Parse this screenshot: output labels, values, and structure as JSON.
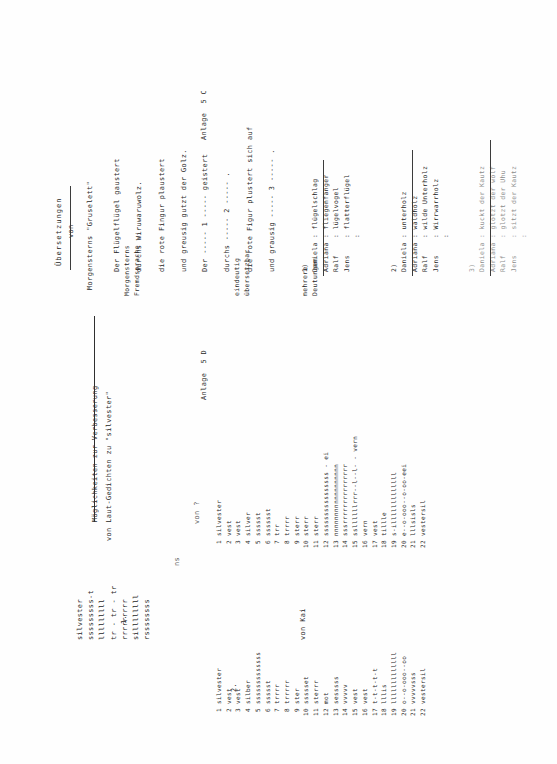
{
  "document": {
    "orientation": "rotated-90-ccw",
    "page_left": {
      "anlage": "Anlage  5 C",
      "title_line1": "Möglichkeiten zur Verbesserung",
      "title_line2": "von Laut-Gedichten zu \"silvester\"",
      "section1_number": "1.",
      "section1_lines": [
        "silvester",
        "sssssssss-t",
        "lllllllll",
        "tr - tr - tr",
        "rrrrrrrrr",
        "sillllllll",
        "rssssssss"
      ],
      "section1_footer_left": "ns",
      "section1_footer_right": "von ?",
      "section2_number": "2.",
      "section2_items": [
        {
          "n": "1",
          "text": "silvester"
        },
        {
          "n": "2",
          "text": "vest"
        },
        {
          "n": "3",
          "text": "vest"
        },
        {
          "n": "4",
          "text": "silber"
        },
        {
          "n": "5",
          "text": "sssssssssssss"
        },
        {
          "n": "6",
          "text": "ssssst"
        },
        {
          "n": "7",
          "text": "trrrr"
        },
        {
          "n": "8",
          "text": "trrrrr"
        },
        {
          "n": "9",
          "text": "ster"
        },
        {
          "n": "10",
          "text": "ssssset"
        },
        {
          "n": "11",
          "text": "sterrr"
        },
        {
          "n": "12",
          "text": "mot"
        },
        {
          "n": "13",
          "text": "sesssss"
        },
        {
          "n": "14",
          "text": "vvvvv"
        },
        {
          "n": "15",
          "text": "vest"
        },
        {
          "n": "16",
          "text": "vest"
        },
        {
          "n": "17",
          "text": "t-t-t-t-t"
        },
        {
          "n": "18",
          "text": "lllis"
        },
        {
          "n": "19",
          "text": "lllllllllllll"
        },
        {
          "n": "20",
          "text": "o--o-ooo--oo"
        },
        {
          "n": "21",
          "text": "vvvvvsss"
        },
        {
          "n": "22",
          "text": "vestersil"
        }
      ],
      "section2_col2_items": [
        {
          "n": "1",
          "text": "silvester"
        },
        {
          "n": "2",
          "text": "vest"
        },
        {
          "n": "3",
          "text": "vest"
        },
        {
          "n": "4",
          "text": "silver"
        },
        {
          "n": "5",
          "text": "ssssst"
        },
        {
          "n": "6",
          "text": "sssssst"
        },
        {
          "n": "7",
          "text": "trr"
        },
        {
          "n": "8",
          "text": "trrrr"
        },
        {
          "n": "9",
          "text": "sterr"
        },
        {
          "n": "10",
          "text": "sterr"
        },
        {
          "n": "11",
          "text": "sterr"
        },
        {
          "n": "12",
          "text": "ssssssssssssssss - ei"
        },
        {
          "n": "13",
          "text": "nnnnnnnnnnnnnnnnnn"
        },
        {
          "n": "14",
          "text": "sssrrrrrrrrrrrrrrr"
        },
        {
          "n": "15",
          "text": "ssllllllrrr--l--l- - vern"
        },
        {
          "n": "16",
          "text": "vern"
        },
        {
          "n": "17",
          "text": "vest"
        },
        {
          "n": "18",
          "text": "tillle"
        },
        {
          "n": "19",
          "text": "s-illlllllllllll"
        },
        {
          "n": "20",
          "text": "e--o-ooo--o-oo-eei"
        },
        {
          "n": "21",
          "text": "lllsisls"
        },
        {
          "n": "22",
          "text": "vestersil"
        }
      ],
      "footer": "von Kai"
    },
    "page_right": {
      "anlage": "Anlage  5 D",
      "header_line1": "Übersetzungen",
      "header_line2": "von",
      "header_line3": "Morgensterns \"Gruselett\"",
      "label_source_line1": "Morgensterns",
      "label_source_line2": "Fremdsprache",
      "label_unique_line1": "eindeutig",
      "label_unique_line2": "übersetzbar",
      "label_multi_line1": "mehrere",
      "label_multi_line2": "Deutungen",
      "poem_original": [
        "Der Flügelflügel gaustert",
        "durchs Wiruwaruwolz.",
        "die rote Fingur plaustert",
        "und greusig gutzt der Golz."
      ],
      "poem_gapped": [
        "Der ----- 1 ----- geistert",
        "durchs ----- 2 ----- .",
        "die rote Figur plustert sich auf",
        "und grausig ----- 3 ----- ."
      ],
      "groups": [
        {
          "number": "1)",
          "rows": [
            {
              "name": "Daniela",
              "sep": ":",
              "value": "flügelschlag"
            },
            {
              "name": "Adriana",
              "sep": ":",
              "value": "fliegenfänger"
            },
            {
              "name": "Ralf",
              "sep": ":",
              "value": "lügelvogel"
            },
            {
              "name": "Jens",
              "sep": ":",
              "value": "flatterflügel"
            },
            {
              "name": "",
              "sep": ":",
              "value": ""
            }
          ]
        },
        {
          "number": "2)",
          "rows": [
            {
              "name": "Daniela",
              "sep": ":",
              "value": "unterholz"
            },
            {
              "name": "Adriana",
              "sep": ":",
              "value": "waldholz"
            },
            {
              "name": "Ralf",
              "sep": ":",
              "value": "wilde Unterholz"
            },
            {
              "name": "Jens",
              "sep": ":",
              "value": "Wirrwarrholz"
            },
            {
              "name": "",
              "sep": ":",
              "value": ""
            }
          ]
        },
        {
          "number": "3)",
          "rows": [
            {
              "name": "Daniela",
              "sep": ":",
              "value": "kuckt der Kautz"
            },
            {
              "name": "Adriana",
              "sep": ":",
              "value": "glotzt der wolf"
            },
            {
              "name": "Ralf",
              "sep": ":",
              "value": "glotzt der Uhu"
            },
            {
              "name": "Jens",
              "sep": ":",
              "value": "sitzt der Kautz"
            },
            {
              "name": "",
              "sep": ":",
              "value": ""
            }
          ]
        }
      ]
    }
  }
}
